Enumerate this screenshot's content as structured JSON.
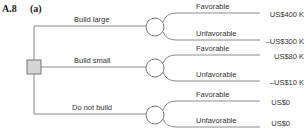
{
  "header": {
    "number": "A.8",
    "part": "(a)"
  },
  "decisions": [
    {
      "label": "Build large",
      "outcomes": [
        {
          "label": "Favorable",
          "payoff": "US$400 K"
        },
        {
          "label": "Unfavorable",
          "payoff": "–US$300 K"
        }
      ]
    },
    {
      "label": "Build small",
      "outcomes": [
        {
          "label": "Favorable",
          "payoff": "US$80 K"
        },
        {
          "label": "Unfavorable",
          "payoff": "–US$10 K"
        }
      ]
    },
    {
      "label": "Do not build",
      "outcomes": [
        {
          "label": "Favorable",
          "payoff": "US$0"
        },
        {
          "label": "Unfavorable",
          "payoff": "US$0"
        }
      ]
    }
  ],
  "colors": {
    "line": "#8a8a8a",
    "node_fill": "#d4d4d4"
  }
}
